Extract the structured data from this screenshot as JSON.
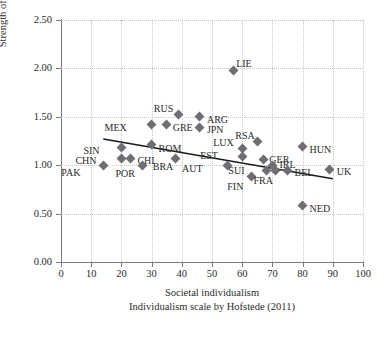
{
  "chart_data": {
    "type": "scatter",
    "title": "",
    "xlabel": "Societal individualism",
    "xsublabel": "Individualism scale by Hofstede (2011)",
    "ylabel": "Strength of succession intention",
    "xlim": [
      0,
      100
    ],
    "ylim": [
      0.0,
      2.5
    ],
    "xticks": [
      "0",
      "10",
      "20",
      "30",
      "40",
      "50",
      "60",
      "70",
      "80",
      "90",
      "100"
    ],
    "yticks": [
      "0.00",
      "0.50",
      "1.00",
      "1.50",
      "2.00",
      "2.50"
    ],
    "grid": true,
    "legend": "none",
    "marker_color": "#6e6e74",
    "trendline_color": "#1a1a1a",
    "gridline_color": "#c8c8c8",
    "axis_color": "#7a7a7a",
    "trendline": {
      "x1": 14,
      "y1": 1.27,
      "x2": 90,
      "y2": 0.86
    },
    "points": [
      {
        "label": "PAK",
        "x": 14,
        "y": 1.0,
        "lx": -23,
        "ly": 8
      },
      {
        "label": "SIN",
        "x": 20,
        "y": 1.18,
        "lx": -22,
        "ly": 3
      },
      {
        "label": "CHN",
        "x": 20,
        "y": 1.07,
        "lx": -25,
        "ly": 3
      },
      {
        "label": "CHI",
        "x": 23,
        "y": 1.07,
        "lx": 7,
        "ly": 3
      },
      {
        "label": "MEX",
        "x": 30,
        "y": 1.42,
        "lx": -25,
        "ly": 3
      },
      {
        "label": "POR",
        "x": 27,
        "y": 1.0,
        "lx": -8,
        "ly": 9
      },
      {
        "label": "GRE",
        "x": 35,
        "y": 1.42,
        "lx": 6,
        "ly": 3
      },
      {
        "label": "ROM",
        "x": 30,
        "y": 1.21,
        "lx": 7,
        "ly": 4
      },
      {
        "label": "BRA",
        "x": 38,
        "y": 1.07,
        "lx": -2,
        "ly": 9
      },
      {
        "label": "RUS",
        "x": 39,
        "y": 1.52,
        "lx": -6,
        "ly": -6
      },
      {
        "label": "JPN",
        "x": 46,
        "y": 1.39,
        "lx": 7,
        "ly": 3
      },
      {
        "label": "ARG",
        "x": 46,
        "y": 1.5,
        "lx": 7,
        "ly": 3
      },
      {
        "label": "LIE",
        "x": 57,
        "y": 1.98,
        "lx": 3,
        "ly": -6
      },
      {
        "label": "LUX",
        "x": 60,
        "y": 1.17,
        "lx": -8,
        "ly": -6
      },
      {
        "label": "EST",
        "x": 60,
        "y": 1.09,
        "lx": -24,
        "ly": 0
      },
      {
        "label": "RSA",
        "x": 65,
        "y": 1.24,
        "lx": -3,
        "ly": -6
      },
      {
        "label": "AUT",
        "x": 55,
        "y": 1.0,
        "lx": -24,
        "ly": 4
      },
      {
        "label": "GER",
        "x": 67,
        "y": 1.06,
        "lx": 6,
        "ly": 1
      },
      {
        "label": "SUI",
        "x": 68,
        "y": 0.95,
        "lx": -22,
        "ly": 1
      },
      {
        "label": "FIN",
        "x": 63,
        "y": 0.88,
        "lx": -8,
        "ly": 10
      },
      {
        "label": "IRL",
        "x": 70,
        "y": 1.0,
        "lx": 7,
        "ly": 0
      },
      {
        "label": "FRA",
        "x": 71,
        "y": 0.95,
        "lx": -3,
        "ly": 11
      },
      {
        "label": "BEL",
        "x": 75,
        "y": 0.95,
        "lx": 7,
        "ly": 3
      },
      {
        "label": "HUN",
        "x": 80,
        "y": 1.19,
        "lx": 7,
        "ly": 3
      },
      {
        "label": "UK",
        "x": 89,
        "y": 0.96,
        "lx": 7,
        "ly": 3
      },
      {
        "label": "NED",
        "x": 80,
        "y": 0.58,
        "lx": 7,
        "ly": 3
      }
    ]
  }
}
